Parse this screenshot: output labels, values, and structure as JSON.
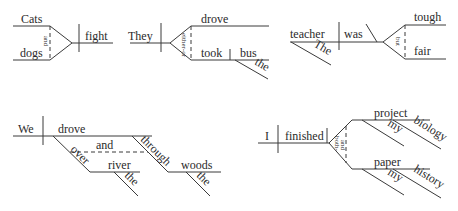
{
  "diagrams": [
    {
      "id": "d1",
      "words": {
        "subject1": "Cats",
        "subject2": "dogs",
        "conjunction": "and",
        "verb": "fight"
      }
    },
    {
      "id": "d2",
      "words": {
        "subject": "They",
        "conjunction": "either-or",
        "verb1": "drove",
        "verb2": "took",
        "object": "bus",
        "article": "the"
      }
    },
    {
      "id": "d3",
      "words": {
        "subject": "teacher",
        "article": "The",
        "verb": "was",
        "conjunction": "but",
        "complement1": "tough",
        "complement2": "fair"
      }
    },
    {
      "id": "d4",
      "words": {
        "subject": "We",
        "verb": "drove",
        "conjunction": "and",
        "prep1": "over",
        "object1": "river",
        "article1": "the",
        "prep2": "through",
        "object2": "woods",
        "article2": "the"
      }
    },
    {
      "id": "d5",
      "words": {
        "subject": "I",
        "verb": "finished",
        "conjunction_top": "both-",
        "conjunction_bottom": "and",
        "object1": "project",
        "modifier1": "my",
        "prep1_object": "biology",
        "object2": "paper",
        "modifier2": "my",
        "prep2_object": "history"
      }
    }
  ]
}
